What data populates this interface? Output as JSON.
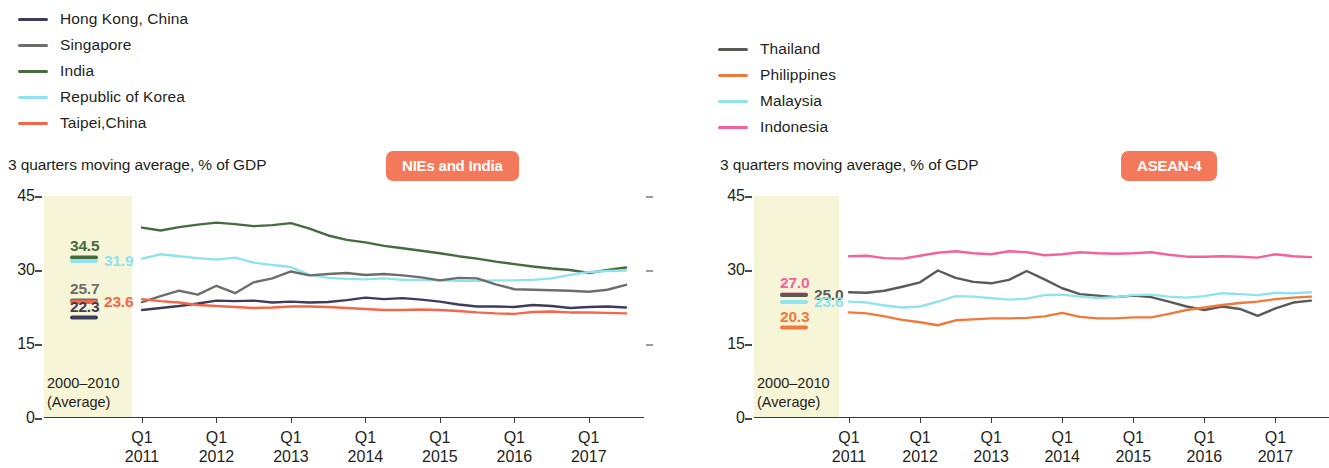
{
  "charts": [
    {
      "id": "nies-and-india",
      "badge": "NIEs and India",
      "badge_color": "#f4795b",
      "subtitle": "3 quarters moving average, % of GDP",
      "band_caption_line1": "2000–2010",
      "band_caption_line2": "(Average)",
      "legend": [
        {
          "label": "Hong Kong, China",
          "color": "#3c3c5c"
        },
        {
          "label": "Singapore",
          "color": "#6d6d6b"
        },
        {
          "label": "India",
          "color": "#456b3f"
        },
        {
          "label": "Republic of Korea",
          "color": "#8fe3ee"
        },
        {
          "label": "Taipei,China",
          "color": "#f4684a"
        }
      ],
      "annotations": [
        {
          "value": "34.5",
          "color": "#456b3f",
          "y": 34.5,
          "place": "above"
        },
        {
          "value": "31.9",
          "color": "#8fe3ee",
          "y": 31.9,
          "place": "right"
        },
        {
          "value": "25.7",
          "color": "#6d6d6b",
          "y": 25.7,
          "place": "above"
        },
        {
          "value": "23.6",
          "color": "#f4684a",
          "y": 23.6,
          "place": "right"
        },
        {
          "value": "22.3",
          "color": "#3c3c5c",
          "y": 22.3,
          "place": "below"
        }
      ],
      "chart_data": {
        "type": "line",
        "title": "NIEs and India",
        "subtitle": "3 quarters moving average, % of GDP",
        "xlabel": "",
        "ylabel": "% of GDP",
        "ylim": [
          0,
          45
        ],
        "yticks": [
          0,
          15,
          30,
          45
        ],
        "grid": false,
        "legend_position": "top-left",
        "shaded_band": {
          "label": "2000–2010 (Average)",
          "values": {
            "India": 34.5,
            "Republic of Korea": 31.9,
            "Singapore": 25.7,
            "Taipei,China": 23.6,
            "Hong Kong, China": 22.3
          }
        },
        "x": [
          "Q1 2011",
          "Q2 2011",
          "Q3 2011",
          "Q4 2011",
          "Q1 2012",
          "Q2 2012",
          "Q3 2012",
          "Q4 2012",
          "Q1 2013",
          "Q2 2013",
          "Q3 2013",
          "Q4 2013",
          "Q1 2014",
          "Q2 2014",
          "Q3 2014",
          "Q4 2014",
          "Q1 2015",
          "Q2 2015",
          "Q3 2015",
          "Q4 2015",
          "Q1 2016",
          "Q2 2016",
          "Q3 2016",
          "Q4 2016",
          "Q1 2017",
          "Q2 2017",
          "Q3 2017"
        ],
        "xtick_labels": [
          {
            "q": "Q1",
            "year": "2011"
          },
          {
            "q": "Q1",
            "year": "2012"
          },
          {
            "q": "Q1",
            "year": "2013"
          },
          {
            "q": "Q1",
            "year": "2014"
          },
          {
            "q": "Q1",
            "year": "2015"
          },
          {
            "q": "Q1",
            "year": "2016"
          },
          {
            "q": "Q1",
            "year": "2017"
          }
        ],
        "series": [
          {
            "name": "India",
            "color": "#456b3f",
            "values": [
              38.6,
              38.0,
              38.7,
              39.2,
              39.6,
              39.3,
              38.9,
              39.1,
              39.5,
              38.4,
              37.0,
              36.1,
              35.6,
              34.9,
              34.4,
              33.9,
              33.4,
              32.8,
              32.3,
              31.7,
              31.2,
              30.7,
              30.3,
              30.0,
              29.4,
              30.0,
              30.5
            ]
          },
          {
            "name": "Republic of Korea",
            "color": "#8fe3ee",
            "values": [
              32.3,
              33.2,
              32.8,
              32.4,
              32.1,
              32.5,
              31.5,
              31.0,
              30.6,
              29.0,
              28.4,
              28.2,
              28.1,
              28.3,
              28.0,
              28.0,
              27.9,
              27.8,
              27.8,
              27.9,
              27.9,
              28.0,
              28.3,
              29.0,
              29.6,
              29.8,
              29.9
            ]
          },
          {
            "name": "Singapore",
            "color": "#6d6d6b",
            "values": [
              23.5,
              24.7,
              25.8,
              25.0,
              26.8,
              25.3,
              27.5,
              28.3,
              29.7,
              28.9,
              29.2,
              29.4,
              29.0,
              29.2,
              28.9,
              28.5,
              27.9,
              28.4,
              28.3,
              27.1,
              26.1,
              26.0,
              25.9,
              25.8,
              25.6,
              26.0,
              27.0
            ]
          },
          {
            "name": "Hong Kong, China",
            "color": "#3c3c5c",
            "values": [
              21.9,
              22.3,
              22.7,
              23.2,
              23.8,
              23.7,
              23.8,
              23.4,
              23.6,
              23.4,
              23.5,
              23.9,
              24.4,
              24.1,
              24.3,
              24.0,
              23.6,
              23.0,
              22.6,
              22.6,
              22.5,
              22.9,
              22.7,
              22.3,
              22.5,
              22.6,
              22.4
            ]
          },
          {
            "name": "Taipei,China",
            "color": "#f4684a",
            "values": [
              24.1,
              23.7,
              23.4,
              22.9,
              22.7,
              22.5,
              22.3,
              22.4,
              22.6,
              22.6,
              22.5,
              22.3,
              22.1,
              21.9,
              21.9,
              22.0,
              21.9,
              21.7,
              21.4,
              21.2,
              21.1,
              21.5,
              21.6,
              21.4,
              21.4,
              21.3,
              21.2
            ]
          }
        ]
      }
    },
    {
      "id": "asean-4",
      "badge": "ASEAN-4",
      "badge_color": "#f4795b",
      "subtitle": "3 quarters moving average, % of GDP",
      "band_caption_line1": "2000–2010",
      "band_caption_line2": "(Average)",
      "legend": [
        {
          "label": "Thailand",
          "color": "#5a5a58"
        },
        {
          "label": "Philippines",
          "color": "#f07a3c"
        },
        {
          "label": "Malaysia",
          "color": "#8fe3ee"
        },
        {
          "label": "Indonesia",
          "color": "#f2629c"
        }
      ],
      "annotations": [
        {
          "value": "27.0",
          "color": "#f2629c",
          "y": 27.0,
          "place": "above"
        },
        {
          "value": "25.0",
          "color": "#5a5a58",
          "y": 25.0,
          "place": "right"
        },
        {
          "value": "23.6",
          "color": "#8fe3ee",
          "y": 23.6,
          "place": "right"
        },
        {
          "value": "20.3",
          "color": "#f07a3c",
          "y": 20.3,
          "place": "below"
        }
      ],
      "chart_data": {
        "type": "line",
        "title": "ASEAN-4",
        "subtitle": "3 quarters moving average, % of GDP",
        "xlabel": "",
        "ylabel": "% of GDP",
        "ylim": [
          0,
          45
        ],
        "yticks": [
          0,
          15,
          30,
          45
        ],
        "grid": false,
        "legend_position": "top-left",
        "shaded_band": {
          "label": "2000–2010 (Average)",
          "values": {
            "Indonesia": 27.0,
            "Thailand": 25.0,
            "Malaysia": 23.6,
            "Philippines": 20.3
          }
        },
        "x": [
          "Q1 2011",
          "Q2 2011",
          "Q3 2011",
          "Q4 2011",
          "Q1 2012",
          "Q2 2012",
          "Q3 2012",
          "Q4 2012",
          "Q1 2013",
          "Q2 2013",
          "Q3 2013",
          "Q4 2013",
          "Q1 2014",
          "Q2 2014",
          "Q3 2014",
          "Q4 2014",
          "Q1 2015",
          "Q2 2015",
          "Q3 2015",
          "Q4 2015",
          "Q1 2016",
          "Q2 2016",
          "Q3 2016",
          "Q4 2016",
          "Q1 2017",
          "Q2 2017",
          "Q3 2017"
        ],
        "xtick_labels": [
          {
            "q": "Q1",
            "year": "2011"
          },
          {
            "q": "Q1",
            "year": "2012"
          },
          {
            "q": "Q1",
            "year": "2013"
          },
          {
            "q": "Q1",
            "year": "2014"
          },
          {
            "q": "Q1",
            "year": "2015"
          },
          {
            "q": "Q1",
            "year": "2016"
          },
          {
            "q": "Q1",
            "year": "2017"
          }
        ],
        "series": [
          {
            "name": "Indonesia",
            "color": "#f2629c",
            "values": [
              32.8,
              32.9,
              32.4,
              32.3,
              32.9,
              33.5,
              33.8,
              33.4,
              33.2,
              33.8,
              33.6,
              33.0,
              33.2,
              33.6,
              33.4,
              33.3,
              33.4,
              33.6,
              33.1,
              32.7,
              32.7,
              32.8,
              32.7,
              32.5,
              33.2,
              32.8,
              32.6
            ]
          },
          {
            "name": "Thailand",
            "color": "#5a5a58",
            "values": [
              25.5,
              25.4,
              25.8,
              26.6,
              27.5,
              29.9,
              28.4,
              27.6,
              27.3,
              28.0,
              29.8,
              28.1,
              26.3,
              25.1,
              24.8,
              24.5,
              24.8,
              24.5,
              23.6,
              22.6,
              21.9,
              22.6,
              22.1,
              20.7,
              22.2,
              23.4,
              23.8
            ]
          },
          {
            "name": "Malaysia",
            "color": "#8fe3ee",
            "values": [
              23.6,
              23.4,
              22.8,
              22.4,
              22.6,
              23.6,
              24.7,
              24.6,
              24.3,
              24.0,
              24.2,
              24.9,
              25.0,
              24.6,
              24.3,
              24.5,
              24.9,
              25.0,
              24.6,
              24.4,
              24.7,
              25.3,
              25.1,
              24.9,
              25.4,
              25.3,
              25.5
            ]
          },
          {
            "name": "Philippines",
            "color": "#f07a3c",
            "values": [
              21.4,
              21.2,
              20.6,
              19.9,
              19.4,
              18.8,
              19.8,
              20.0,
              20.2,
              20.2,
              20.3,
              20.6,
              21.3,
              20.5,
              20.2,
              20.2,
              20.4,
              20.4,
              21.1,
              21.9,
              22.4,
              22.9,
              23.3,
              23.6,
              24.1,
              24.4,
              24.6
            ]
          }
        ]
      }
    }
  ]
}
